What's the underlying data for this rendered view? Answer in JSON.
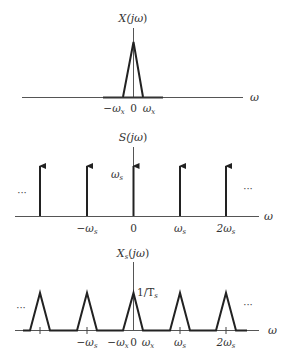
{
  "colors": {
    "background": "#ffffff",
    "line": "#333333",
    "axis": "#555555"
  },
  "panels": [
    {
      "id": "x-spectrum",
      "title": "X(jω)",
      "axis_label": "ω",
      "peak_label": "",
      "tick_labels": [
        "−ωx",
        "0",
        "ωx"
      ],
      "shape": "single triangle centered at 0 with half-width ωx"
    },
    {
      "id": "s-spectrum",
      "title": "S(jω)",
      "axis_label": "ω",
      "impulse_height_label": "ωs",
      "tick_labels": [
        "−ωs",
        "0",
        "ωs",
        "2ωs"
      ],
      "left_ellipsis": "···",
      "right_ellipsis": "···",
      "shape": "impulse train at multiples of ωs"
    },
    {
      "id": "xs-spectrum",
      "title": "Xs(jω)",
      "axis_label": "ω",
      "peak_label": "1/Ts",
      "tick_labels": [
        "−ωs",
        "−ωx",
        "0",
        "ωx",
        "ωs",
        "2ωs"
      ],
      "left_ellipsis": "···",
      "right_ellipsis": "···",
      "shape": "periodic triangles centered at multiples of ωs"
    }
  ],
  "text": {
    "p1_title_main": "X(",
    "p1_title_j": "jω",
    "p1_title_close": ")",
    "p1_axis": "ω",
    "p1_tick_neg": "−ω",
    "p1_tick_neg_sub": "x",
    "p1_tick_zero": "0",
    "p1_tick_pos": "ω",
    "p1_tick_pos_sub": "x",
    "p2_title_main": "S(",
    "p2_title_j": "jω",
    "p2_title_close": ")",
    "p2_axis": "ω",
    "p2_height": "ω",
    "p2_height_sub": "s",
    "p2_tick_m1": "−ω",
    "p2_tick_m1_sub": "s",
    "p2_tick_0": "0",
    "p2_tick_1": "ω",
    "p2_tick_1_sub": "s",
    "p2_tick_2": "2ω",
    "p2_tick_2_sub": "s",
    "p2_dots_left": "···",
    "p2_dots_right": "···",
    "p3_title_main": "X",
    "p3_title_sub": "s",
    "p3_title_rest": "(",
    "p3_title_j": "jω",
    "p3_title_close": ")",
    "p3_axis": "ω",
    "p3_peak": "1/T",
    "p3_peak_sub": "s",
    "p3_tick_m1": "−ω",
    "p3_tick_m1_sub": "s",
    "p3_tick_negx": "−ω",
    "p3_tick_negx_sub": "x",
    "p3_tick_0": "0",
    "p3_tick_posx": "ω",
    "p3_tick_posx_sub": "x",
    "p3_tick_1": "ω",
    "p3_tick_1_sub": "s",
    "p3_tick_2": "2ω",
    "p3_tick_2_sub": "s",
    "p3_dots_left": "···",
    "p3_dots_right": "···"
  }
}
